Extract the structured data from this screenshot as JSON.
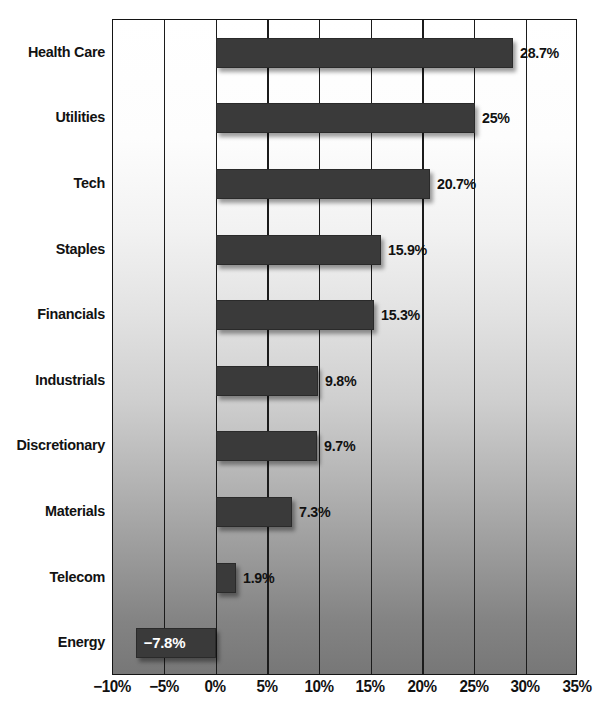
{
  "chart_data": {
    "type": "bar",
    "orientation": "horizontal",
    "title": "",
    "subtitle": "",
    "xlabel": "",
    "ylabel": "",
    "categories": [
      "Health Care",
      "Utilities",
      "Tech",
      "Staples",
      "Financials",
      "Industrials",
      "Discretionary",
      "Materials",
      "Telecom",
      "Energy"
    ],
    "values": [
      28.7,
      25,
      20.7,
      15.9,
      15.3,
      9.8,
      9.7,
      7.3,
      1.9,
      -7.8
    ],
    "value_labels": [
      "28.7%",
      "25%",
      "20.7%",
      "15.9%",
      "15.3%",
      "9.8%",
      "9.7%",
      "7.3%",
      "1.9%",
      "−7.8%"
    ],
    "xlim": [
      -10,
      35
    ],
    "xticks": [
      -10,
      -5,
      0,
      5,
      10,
      15,
      20,
      25,
      30,
      35
    ],
    "xtick_labels": [
      "−10%",
      "−5%",
      "0%",
      "5%",
      "10%",
      "15%",
      "20%",
      "25%",
      "30%",
      "35%"
    ],
    "grid": "vertical",
    "legend": "none",
    "colors": {
      "bar": "#3a3a3a",
      "bar_border": "#2a2a2a",
      "text": "#111111",
      "inside_label": "#ffffff",
      "gridline": "#1b1b1b",
      "plot_border": "#141414",
      "background_top": "#ffffff",
      "background_bottom": "#777777"
    }
  }
}
